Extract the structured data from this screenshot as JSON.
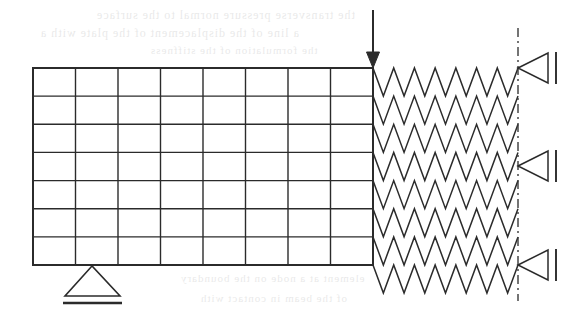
{
  "figure": {
    "background_color": "#ffffff",
    "line_color": "#2b2b2b",
    "width": 577,
    "height": 314
  },
  "mesh": {
    "name": "rectangular-finite-element-mesh",
    "left": 33,
    "top": 68,
    "right": 373,
    "bottom": 265,
    "columns": 8,
    "rows": 7,
    "column_x": [
      33,
      75.5,
      118,
      160.5,
      203,
      245.5,
      288,
      330.5,
      373
    ],
    "row_y": [
      68,
      96.1,
      124.3,
      152.4,
      180.6,
      208.7,
      236.9,
      265
    ],
    "outer_stroke_width": 2,
    "inner_stroke_width": 1.4,
    "stroke": "#2b2b2b"
  },
  "load": {
    "name": "point-load-arrow",
    "x": 373,
    "y_start": 10,
    "y_end": 68,
    "direction": "down",
    "head_width": 13,
    "head_length": 16,
    "stroke_width": 2,
    "color": "#2b2b2b"
  },
  "support": {
    "name": "pinned-support",
    "apex_x": 92,
    "apex_y": 266,
    "base_left_x": 65,
    "base_right_x": 120,
    "base_y": 296,
    "ground_left_x": 63,
    "ground_right_x": 122,
    "ground_y": 303,
    "stroke_width": 1.6,
    "ground_stroke_width": 2.4,
    "color": "#2b2b2b"
  },
  "springs": {
    "name": "elastic-foundation-springs",
    "count": 8,
    "x_start": 373,
    "x_end": 518,
    "cycles": 7,
    "amplitude": 28.1,
    "stroke_width": 1.5,
    "color": "#2b2b2b",
    "anchor_y": [
      68,
      96.1,
      124.3,
      152.4,
      180.6,
      208.7,
      236.9,
      265
    ]
  },
  "centerline": {
    "name": "symmetry-centerline",
    "x": 518,
    "y_start": 28,
    "y_end": 301,
    "dash_pattern": "9 4 2 4",
    "stroke_width": 1.4,
    "color": "#3a3a3a"
  },
  "boundary_supports": {
    "name": "roller-boundary-symbols",
    "count": 3,
    "y_positions": [
      68,
      166,
      265
    ],
    "apex_x": 518,
    "base_x": 548,
    "half_height": 15,
    "bar_x": 556,
    "bar_half_height": 16,
    "stroke_width": 1.5,
    "color": "#2b2b2b"
  },
  "ghost_text": {
    "name": "scan-bleed-through-text",
    "description": "faint mirrored show-through text from the reverse side of the scanned page",
    "lines": [
      {
        "text": "the transverse pressure normal to the surface",
        "x": 96,
        "y": 8,
        "size": 12
      },
      {
        "text": "a line of the displacement of the plate with a",
        "x": 40,
        "y": 26,
        "size": 12
      },
      {
        "text": "the  formulation  of  the  stiffness",
        "x": 150,
        "y": 44,
        "size": 11
      },
      {
        "text": "element  at  a  node  on  the  boundary",
        "x": 180,
        "y": 272,
        "size": 11
      },
      {
        "text": "of  the  beam  in  contact  with",
        "x": 200,
        "y": 292,
        "size": 11
      }
    ]
  }
}
